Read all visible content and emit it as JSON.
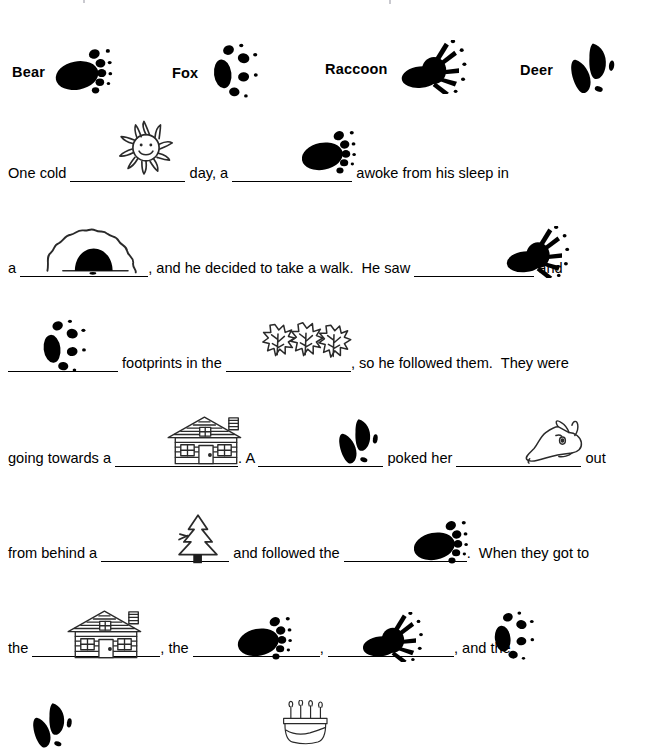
{
  "document": {
    "type": "animal-tracks-story-worksheet",
    "ink_color": "#000000",
    "background_color": "#ffffff"
  },
  "legend": {
    "items": [
      {
        "label": "Bear",
        "icon": "bear-track-icon",
        "x": 12,
        "y": 24
      },
      {
        "label": "Fox",
        "icon": "fox-track-icon",
        "x": 172,
        "y": 24
      },
      {
        "label": "Raccoon",
        "icon": "raccoon-track-icon",
        "x": 325,
        "y": 20
      },
      {
        "label": "Deer",
        "icon": "deer-track-icon",
        "x": 520,
        "y": 22
      }
    ]
  },
  "story": {
    "lines": [
      {
        "id": "line-1",
        "pictures": [
          {
            "icon": "sun-icon",
            "x": 110,
            "y": 118,
            "w": 72,
            "h": 58
          },
          {
            "icon": "bear-track-icon",
            "x": 296,
            "y": 128,
            "w": 62,
            "h": 46
          }
        ],
        "segments": [
          {
            "type": "text",
            "value": "One cold "
          },
          {
            "type": "blank",
            "width": 115
          },
          {
            "type": "text",
            "value": " day, a "
          },
          {
            "type": "blank",
            "width": 120
          },
          {
            "type": "text",
            "value": " awoke from his sleep in"
          }
        ]
      },
      {
        "id": "line-2",
        "pictures": [
          {
            "icon": "cave-icon",
            "x": 44,
            "y": 226,
            "w": 96,
            "h": 50
          },
          {
            "icon": "raccoon-track-icon",
            "x": 500,
            "y": 226,
            "w": 72,
            "h": 52
          }
        ],
        "segments": [
          {
            "type": "text",
            "value": "a "
          },
          {
            "type": "blank",
            "width": 128
          },
          {
            "type": "text",
            "value": ", and he decided to take a walk.  He saw "
          },
          {
            "type": "blank",
            "width": 120
          },
          {
            "type": "text",
            "value": " and"
          }
        ]
      },
      {
        "id": "line-3",
        "pictures": [
          {
            "icon": "fox-track-icon",
            "x": 30,
            "y": 318,
            "w": 62,
            "h": 56
          },
          {
            "icon": "leaves-icon",
            "x": 258,
            "y": 318,
            "w": 96,
            "h": 48
          }
        ],
        "segments": [
          {
            "type": "blank",
            "width": 110
          },
          {
            "type": "text",
            "value": " footprints in the "
          },
          {
            "type": "blank",
            "width": 125
          },
          {
            "type": "text",
            "value": ", so he followed them.  They were"
          }
        ]
      },
      {
        "id": "line-4",
        "pictures": [
          {
            "icon": "cabin-icon",
            "x": 165,
            "y": 414,
            "w": 82,
            "h": 52
          },
          {
            "icon": "deer-track-icon",
            "x": 330,
            "y": 416,
            "w": 52,
            "h": 50
          },
          {
            "icon": "animal-head-icon",
            "x": 515,
            "y": 418,
            "w": 76,
            "h": 48
          }
        ],
        "segments": [
          {
            "type": "text",
            "value": "going towards a "
          },
          {
            "type": "blank",
            "width": 123
          },
          {
            "type": "text",
            "value": ". A "
          },
          {
            "type": "blank",
            "width": 125
          },
          {
            "type": "text",
            "value": " poked her "
          },
          {
            "type": "blank",
            "width": 125
          },
          {
            "type": "text",
            "value": " out"
          }
        ]
      },
      {
        "id": "line-5",
        "pictures": [
          {
            "icon": "pine-tree-icon",
            "x": 163,
            "y": 512,
            "w": 70,
            "h": 52
          },
          {
            "icon": "bear-track-icon",
            "x": 408,
            "y": 518,
            "w": 62,
            "h": 46
          }
        ],
        "segments": [
          {
            "type": "text",
            "value": "from behind a "
          },
          {
            "type": "blank",
            "width": 128
          },
          {
            "type": "text",
            "value": " and followed the "
          },
          {
            "type": "blank",
            "width": 123
          },
          {
            "type": "text",
            "value": ".  When they got to"
          }
        ]
      },
      {
        "id": "line-6",
        "pictures": [
          {
            "icon": "cabin-icon",
            "x": 65,
            "y": 608,
            "w": 82,
            "h": 52
          },
          {
            "icon": "bear-track-icon",
            "x": 232,
            "y": 614,
            "w": 62,
            "h": 46
          },
          {
            "icon": "raccoon-track-icon",
            "x": 355,
            "y": 612,
            "w": 72,
            "h": 50
          },
          {
            "icon": "fox-track-icon",
            "x": 482,
            "y": 610,
            "w": 58,
            "h": 52
          }
        ],
        "segments": [
          {
            "type": "text",
            "value": "the "
          },
          {
            "type": "blank",
            "width": 128
          },
          {
            "type": "text",
            "value": ", the "
          },
          {
            "type": "blank",
            "width": 127
          },
          {
            "type": "text",
            "value": ", "
          },
          {
            "type": "blank",
            "width": 126
          },
          {
            "type": "text",
            "value": ", and the"
          }
        ]
      },
      {
        "id": "line-7",
        "pictures": [
          {
            "icon": "deer-track-icon",
            "x": 22,
            "y": 700,
            "w": 56,
            "h": 50
          },
          {
            "icon": "cake-icon",
            "x": 275,
            "y": 700,
            "w": 58,
            "h": 46
          }
        ],
        "segments": []
      }
    ]
  }
}
